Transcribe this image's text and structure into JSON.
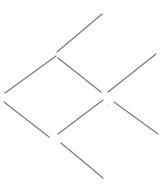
{
  "canvas": {
    "width": 165,
    "height": 192,
    "background_color": "#ffffff"
  },
  "pattern": {
    "stroke_color": "#7b7b7b",
    "stroke_width": 1.25,
    "segments": [
      {
        "name": "top-spoke",
        "x1": 57,
        "y1": 52,
        "x2": 102,
        "y2": 14
      },
      {
        "name": "diamond-upper-left-edge",
        "x1": 56,
        "y1": 56,
        "x2": 5,
        "y2": 93
      },
      {
        "name": "diamond-upper-right-edge",
        "x1": 58,
        "y1": 58,
        "x2": 101,
        "y2": 92
      },
      {
        "name": "right-upper-spoke",
        "x1": 156,
        "y1": 54,
        "x2": 108,
        "y2": 92
      },
      {
        "name": "diamond-lower-left-edge",
        "x1": 4,
        "y1": 102,
        "x2": 49,
        "y2": 137
      },
      {
        "name": "diamond-lower-right-edge",
        "x1": 103,
        "y1": 100,
        "x2": 58,
        "y2": 134
      },
      {
        "name": "right-lower-spoke",
        "x1": 114,
        "y1": 102,
        "x2": 158,
        "y2": 134
      },
      {
        "name": "bottom-spoke",
        "x1": 61,
        "y1": 143,
        "x2": 103,
        "y2": 178
      }
    ],
    "speck": {
      "x": 108.5,
      "y": 106,
      "radius": 0.7,
      "color": "#cfcfcf"
    }
  }
}
